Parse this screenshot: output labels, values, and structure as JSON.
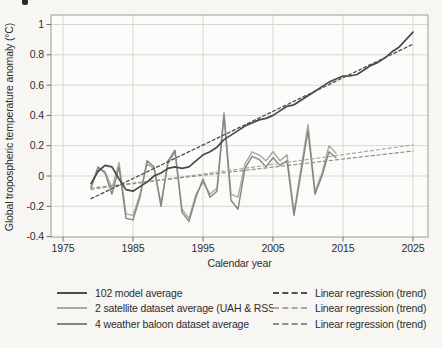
{
  "colors": {
    "background": "#f7f6f3",
    "plot_background": "#fbfbf9",
    "grid": "#d8d7d3",
    "frame": "#9b9a96",
    "tick": "#6f6e6b",
    "text": "#2e2d2b"
  },
  "chart_data": {
    "type": "line",
    "title": "",
    "xlabel": "Calendar year",
    "ylabel": "Global tropospheric temperature anomaly (°C)",
    "xlim": [
      1973.3,
      2027.2
    ],
    "ylim": [
      -0.4,
      1.06
    ],
    "grid": true,
    "legend_position": "bottom",
    "xticks": [
      {
        "value": 1975,
        "label": "1975"
      },
      {
        "value": 1985,
        "label": "1985"
      },
      {
        "value": 1995,
        "label": "1995"
      },
      {
        "value": 2005,
        "label": "2005"
      },
      {
        "value": 2015,
        "label": "2015"
      },
      {
        "value": 2025,
        "label": "2025"
      }
    ],
    "yticks": [
      {
        "value": 1,
        "label": "1"
      },
      {
        "value": 0.8,
        "label": "0.8"
      },
      {
        "value": 0.6,
        "label": "0.6"
      },
      {
        "value": 0.4,
        "label": "0.4"
      },
      {
        "value": 0.2,
        "label": "0.2"
      },
      {
        "value": 0,
        "label": "0"
      },
      {
        "value": -0.2,
        "label": "-0.2"
      },
      {
        "value": -0.4,
        "label": "-0.4"
      }
    ],
    "series": [
      {
        "name": "satellite",
        "color": "#a9a8a4",
        "width": 1.4,
        "dash": null,
        "x": [
          1979,
          1980,
          1981,
          1982,
          1983,
          1984,
          1985,
          1986,
          1987,
          1988,
          1989,
          1990,
          1991,
          1992,
          1993,
          1994,
          1995,
          1996,
          1997,
          1998,
          1999,
          2000,
          2001,
          2002,
          2003,
          2004,
          2005,
          2006,
          2007,
          2008,
          2009,
          2010,
          2011,
          2012,
          2013,
          2014
        ],
        "y": [
          -0.07,
          0.05,
          0.03,
          -0.08,
          0.09,
          -0.25,
          -0.26,
          -0.12,
          0.08,
          0.05,
          -0.18,
          0.08,
          0.16,
          -0.22,
          -0.28,
          -0.12,
          -0.04,
          -0.12,
          -0.08,
          0.42,
          -0.12,
          -0.14,
          0.08,
          0.16,
          0.14,
          0.1,
          0.16,
          0.1,
          0.14,
          -0.24,
          0.05,
          0.34,
          -0.1,
          0.02,
          0.2,
          0.15
        ]
      },
      {
        "name": "balloon",
        "color": "#858480",
        "width": 1.4,
        "dash": null,
        "x": [
          1979,
          1980,
          1981,
          1982,
          1983,
          1984,
          1985,
          1986,
          1987,
          1988,
          1989,
          1990,
          1991,
          1992,
          1993,
          1994,
          1995,
          1996,
          1997,
          1998,
          1999,
          2000,
          2001,
          2002,
          2003,
          2004,
          2005,
          2006,
          2007,
          2008,
          2009,
          2010,
          2011,
          2012,
          2013,
          2014
        ],
        "y": [
          -0.08,
          0.06,
          0.02,
          -0.12,
          0.06,
          -0.28,
          -0.29,
          -0.14,
          0.1,
          0.06,
          -0.2,
          0.1,
          0.17,
          -0.24,
          -0.3,
          -0.14,
          -0.02,
          -0.14,
          -0.1,
          0.4,
          -0.16,
          -0.22,
          0.05,
          0.13,
          0.11,
          0.06,
          0.12,
          0.07,
          0.1,
          -0.26,
          0.02,
          0.3,
          -0.12,
          0.0,
          0.16,
          0.12
        ]
      },
      {
        "name": "satellite_trend",
        "color": "#a9a8a4",
        "width": 1.2,
        "dash": "3.2 2.8",
        "x": [
          1979,
          2025
        ],
        "y": [
          -0.09,
          0.205
        ]
      },
      {
        "name": "balloon_trend",
        "color": "#8f8e8a",
        "width": 1.2,
        "dash": "3.2 2.8",
        "x": [
          1979,
          2025
        ],
        "y": [
          -0.08,
          0.165
        ]
      },
      {
        "name": "model",
        "color": "#4b4a48",
        "width": 1.7,
        "dash": null,
        "x": [
          1979,
          1980,
          1981,
          1982,
          1983,
          1984,
          1985,
          1986,
          1987,
          1988,
          1989,
          1990,
          1991,
          1992,
          1993,
          1994,
          1995,
          1996,
          1997,
          1998,
          1999,
          2000,
          2001,
          2002,
          2003,
          2004,
          2005,
          2006,
          2007,
          2008,
          2009,
          2010,
          2011,
          2012,
          2013,
          2014,
          2015,
          2016,
          2017,
          2018,
          2019,
          2020,
          2021,
          2022,
          2023,
          2024,
          2025
        ],
        "y": [
          -0.05,
          0.03,
          0.07,
          0.06,
          -0.02,
          -0.09,
          -0.1,
          -0.07,
          -0.04,
          0.0,
          0.02,
          0.05,
          0.06,
          0.05,
          0.06,
          0.1,
          0.14,
          0.16,
          0.19,
          0.24,
          0.27,
          0.3,
          0.33,
          0.35,
          0.37,
          0.38,
          0.4,
          0.43,
          0.46,
          0.47,
          0.5,
          0.53,
          0.56,
          0.59,
          0.62,
          0.64,
          0.66,
          0.66,
          0.67,
          0.7,
          0.73,
          0.75,
          0.78,
          0.82,
          0.85,
          0.9,
          0.95
        ]
      },
      {
        "name": "model_trend",
        "color": "#4f4e4c",
        "width": 1.3,
        "dash": "3 2.6",
        "x": [
          1979,
          2025
        ],
        "y": [
          -0.15,
          0.87
        ]
      }
    ]
  },
  "legend": {
    "rows": [
      {
        "label": "102 model average",
        "series": "model",
        "trend_label": "Linear regression (trend)",
        "trend_series": "model_trend"
      },
      {
        "label": "2 satellite dataset average (UAH & RSS)",
        "series": "satellite",
        "trend_label": "Linear regression (trend)",
        "trend_series": "satellite_trend"
      },
      {
        "label": "4 weather baloon dataset average",
        "series": "balloon",
        "trend_label": "Linear regression (trend)",
        "trend_series": "balloon_trend"
      }
    ]
  }
}
